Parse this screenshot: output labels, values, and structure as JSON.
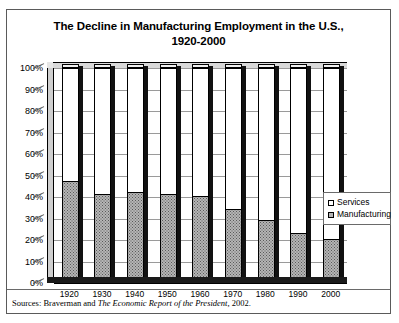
{
  "chart_data": {
    "type": "bar",
    "stacked": true,
    "title": "The Decline in Manufacturing Employment in the U.S., 1920-2000",
    "title_line1": "The Decline in Manufacturing Employment in the U.S.,",
    "title_line2": "1920-2000",
    "xlabel": "",
    "ylabel": "",
    "categories": [
      "1920",
      "1930",
      "1940",
      "1950",
      "1960",
      "1970",
      "1980",
      "1990",
      "2000"
    ],
    "ylim": [
      0,
      100
    ],
    "ytick_labels": [
      "0%",
      "10%",
      "20%",
      "30%",
      "40%",
      "50%",
      "60%",
      "70%",
      "80%",
      "90%",
      "100%"
    ],
    "ytick_values": [
      0,
      10,
      20,
      30,
      40,
      50,
      60,
      70,
      80,
      90,
      100
    ],
    "grid": true,
    "legend_position": "right",
    "series": [
      {
        "name": "Services",
        "fill": "white",
        "values": [
          53,
          59,
          58,
          59,
          60,
          66,
          71,
          77,
          80
        ]
      },
      {
        "name": "Manufacturing",
        "fill": "gray-stipple",
        "values": [
          47,
          41,
          42,
          41,
          40,
          34,
          29,
          23,
          20
        ]
      }
    ]
  },
  "legend": {
    "items": [
      {
        "label": "Services",
        "key": "services"
      },
      {
        "label": "Manufacturing",
        "key": "manufacturing"
      }
    ]
  },
  "source": {
    "prefix": "Sources: Braverman and ",
    "italic": "The Economic Report of the President",
    "suffix": ", 2002."
  },
  "colors": {
    "frame": "#5a5a5a",
    "axis": "#000000",
    "gridline": "#9a9a9a",
    "services_fill": "#ffffff",
    "manufacturing_fill": "#b5b5b5",
    "bar_side_shadow": "#111111",
    "background": "#ffffff"
  }
}
